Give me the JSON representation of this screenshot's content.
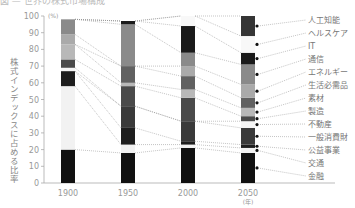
{
  "title": "図 — 世界の株式市場構成",
  "chart_data": {
    "type": "bar",
    "stacked": true,
    "normalized": true,
    "title": "",
    "xlabel": "(年)",
    "ylabel": "株式インデックスに占める比率",
    "yunit": "(%)",
    "ylim": [
      0,
      100
    ],
    "yticks": [
      0,
      10,
      20,
      30,
      40,
      50,
      60,
      70,
      80,
      90,
      100
    ],
    "categories": [
      "1900",
      "1950",
      "2000",
      "2050"
    ],
    "legend_position": "right",
    "grid": false,
    "series_order_bottom_to_top": [
      "金融",
      "交通",
      "公益事業",
      "一般消費財",
      "不動産",
      "製造",
      "素材",
      "生活必需品",
      "エネルギー",
      "通信",
      "IT",
      "ヘルスケア",
      "人工知能"
    ],
    "series": [
      {
        "name": "金融",
        "color": "#111111",
        "values": [
          20,
          18,
          21,
          18
        ]
      },
      {
        "name": "交通",
        "color": "#f2f2f2",
        "values": [
          38,
          5,
          2,
          3
        ]
      },
      {
        "name": "公益事業",
        "color": "#1e1e1e",
        "values": [
          9,
          10,
          2,
          2
        ]
      },
      {
        "name": "一般消費財",
        "color": "#3a3a3a",
        "values": [
          0,
          13,
          12,
          10
        ]
      },
      {
        "name": "不動産",
        "color": "#f5f5f5",
        "values": [
          2,
          0,
          0,
          4
        ]
      },
      {
        "name": "製造",
        "color": "#4a4a4a",
        "values": [
          5,
          12,
          14,
          3
        ]
      },
      {
        "name": "素材",
        "color": "#b8b8b8",
        "values": [
          9,
          2,
          5,
          5
        ]
      },
      {
        "name": "生活必需品",
        "color": "#616161",
        "values": [
          0,
          10,
          8,
          6
        ]
      },
      {
        "name": "エネルギー",
        "color": "#aaaaaa",
        "values": [
          6,
          0,
          6,
          8
        ]
      },
      {
        "name": "通信",
        "color": "#8a8a8a",
        "values": [
          9,
          25,
          8,
          12
        ]
      },
      {
        "name": "IT",
        "color": "#1a1a1a",
        "values": [
          0,
          2,
          16,
          7
        ]
      },
      {
        "name": "ヘルスケア",
        "color": "#f8f8f8",
        "values": [
          0,
          0,
          6,
          10
        ]
      },
      {
        "name": "人工知能",
        "color": "#353535",
        "values": [
          0,
          0,
          0,
          12
        ]
      }
    ],
    "note": "1900 bar: top segment (~92-100) medium gray; values approximate from pixel heights"
  },
  "labels": {
    "x_unit": "(年)",
    "y_unit": "(%)",
    "y_title": "株式インデックスに占める比率"
  }
}
